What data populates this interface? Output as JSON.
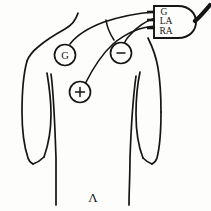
{
  "diagram": {
    "background_color": "#fdfdfc",
    "ink_color": "#151515",
    "connector": {
      "name": "lead-wire-connector",
      "pin_count": 3,
      "pins": [
        {
          "label": "G",
          "meaning": "Ground"
        },
        {
          "label": "LA",
          "meaning": "Left Arm"
        },
        {
          "label": "RA",
          "meaning": "Right Arm"
        }
      ],
      "cable_label": ""
    },
    "electrodes": [
      {
        "id": "ground",
        "label": "G",
        "position": "left upper chest / right shoulder of subject"
      },
      {
        "id": "negative",
        "label": "-",
        "position": "upper chest, right of center"
      },
      {
        "id": "positive",
        "label": "+",
        "position": "mid chest, left of center"
      }
    ],
    "annotations": [
      {
        "id": "bottom-center-mark",
        "label": "Λ"
      },
      {
        "id": "bottom-left-mark",
        "label": ""
      }
    ]
  }
}
